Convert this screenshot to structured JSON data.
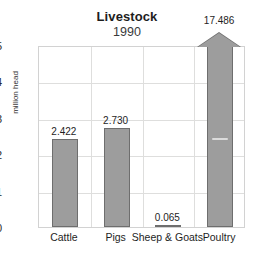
{
  "chart_data": {
    "type": "bar",
    "title": "Livestock",
    "subtitle": "1990",
    "xlabel": "",
    "ylabel": "million head",
    "categories": [
      "Cattle",
      "Pigs",
      "Sheep & Goats",
      "Poultry"
    ],
    "values": [
      2.422,
      2.73,
      0.065,
      17.486
    ],
    "value_labels": [
      "2.422",
      "2.730",
      "0.065",
      "17.486"
    ],
    "ylim": [
      0,
      5
    ],
    "y_ticks": [
      0,
      1,
      2,
      3,
      4,
      5
    ],
    "y_tick_labels": [
      "0",
      "1",
      "2",
      "3",
      "4",
      "5"
    ],
    "grid": true,
    "grid_axes": "both",
    "legend": "none",
    "clipped_bars": [
      "Poultry"
    ],
    "clip_note": "Poultry bar exceeds axis maximum and is drawn broken with an upward arrowhead",
    "colors": {
      "bar_fill": "#9d9d9d",
      "bar_outline": "#6e6e6e",
      "grid": "#dededd",
      "plot_border": "#d2d2d2",
      "background": "#ffffff",
      "text": "#1e1e1e"
    }
  }
}
